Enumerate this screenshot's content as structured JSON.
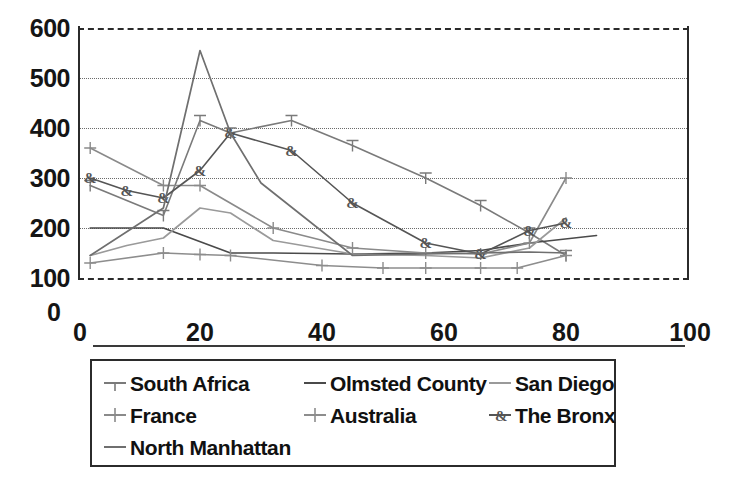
{
  "chart_data": {
    "type": "line",
    "title": "",
    "subtitle": "",
    "xlabel": "",
    "ylabel": "",
    "xlim": [
      0,
      100
    ],
    "ylim": [
      100,
      600
    ],
    "xticks": [
      0,
      20,
      40,
      60,
      80,
      100
    ],
    "yticks": [
      100,
      200,
      300,
      400,
      500,
      600
    ],
    "y_axis_origin_label": "0",
    "grid": "horizontal-dotted",
    "legend_position": "below-plot",
    "legend_columns": 3,
    "series": [
      {
        "name": "South Africa",
        "marker": "tee",
        "color": "#7a7a7a",
        "x": [
          2,
          14,
          20,
          25,
          35,
          45,
          57,
          66,
          74,
          80
        ],
        "values": [
          285,
          225,
          415,
          390,
          415,
          365,
          300,
          245,
          190,
          145
        ]
      },
      {
        "name": "Olmsted County",
        "marker": "none",
        "color": "#4a4a4a",
        "x": [
          2,
          14,
          25,
          32,
          45,
          57,
          66,
          74,
          85
        ],
        "values": [
          200,
          200,
          150,
          150,
          148,
          150,
          155,
          170,
          185
        ]
      },
      {
        "name": "San Diego",
        "marker": "none",
        "color": "#9a9a9a",
        "x": [
          2,
          8,
          14,
          20,
          25,
          32,
          45,
          57,
          66,
          74,
          80
        ],
        "values": [
          145,
          165,
          180,
          240,
          230,
          175,
          148,
          145,
          140,
          160,
          220
        ]
      },
      {
        "name": "France",
        "marker": "plus",
        "color": "#8a8a8a",
        "x": [
          2,
          14,
          20,
          32,
          45,
          57,
          66,
          74,
          80
        ],
        "values": [
          360,
          285,
          285,
          200,
          160,
          150,
          148,
          170,
          300
        ]
      },
      {
        "name": "Australia",
        "marker": "plus",
        "color": "#8d8d8d",
        "x": [
          2,
          14,
          20,
          25,
          40,
          50,
          57,
          66,
          72,
          80
        ],
        "values": [
          130,
          150,
          147,
          145,
          125,
          120,
          120,
          120,
          120,
          145
        ]
      },
      {
        "name": "The Bronx",
        "marker": "ampersand",
        "color": "#555555",
        "x": [
          2,
          8,
          14,
          20,
          25,
          35,
          45,
          57,
          66,
          74,
          80
        ],
        "values": [
          300,
          275,
          260,
          315,
          390,
          355,
          250,
          170,
          148,
          195,
          210
        ]
      },
      {
        "name": "North Manhattan",
        "marker": "none",
        "color": "#6f6f6f",
        "x": [
          2,
          14,
          20,
          25,
          30,
          45,
          57,
          66,
          74,
          80
        ],
        "values": [
          145,
          240,
          555,
          390,
          290,
          145,
          148,
          150,
          152,
          150
        ]
      }
    ]
  },
  "axes": {
    "y_labels": [
      "600",
      "500",
      "400",
      "300",
      "200",
      "100"
    ],
    "y_zero_label": "0",
    "x_labels": [
      "0",
      "20",
      "40",
      "60",
      "80",
      "100"
    ]
  },
  "legend": {
    "entries": [
      {
        "label": "South Africa",
        "marker": "tee-marker-icon"
      },
      {
        "label": "Olmsted County",
        "marker": "line-marker-icon"
      },
      {
        "label": "San Diego",
        "marker": "line-marker-icon"
      },
      {
        "label": "France",
        "marker": "plus-marker-icon"
      },
      {
        "label": "Australia",
        "marker": "plus-marker-icon"
      },
      {
        "label": "The Bronx",
        "marker": "ampersand-marker-icon"
      },
      {
        "label": "North Manhattan",
        "marker": "line-marker-icon"
      }
    ]
  },
  "colors": {
    "axis": "#2b2b2b",
    "grid": "#6b6b6b",
    "text": "#151515",
    "background": "#ffffff"
  }
}
